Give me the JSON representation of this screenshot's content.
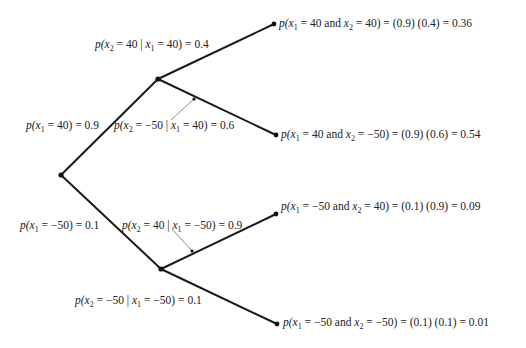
{
  "diagram": {
    "type": "probability-tree",
    "nodes": {
      "root": {
        "x": 61,
        "y": 175
      },
      "mid_upper": {
        "x": 158,
        "y": 79
      },
      "mid_lower": {
        "x": 161,
        "y": 269
      },
      "leaf_1": {
        "x": 274,
        "y": 24
      },
      "leaf_2": {
        "x": 276,
        "y": 135
      },
      "leaf_3": {
        "x": 276,
        "y": 214
      },
      "leaf_4": {
        "x": 277,
        "y": 324
      }
    },
    "edges": [
      {
        "from": "root",
        "to": "mid_upper",
        "label": "p(x1 = 40) = 0.9"
      },
      {
        "from": "root",
        "to": "mid_lower",
        "label": "p(x1 = −50) = 0.1"
      },
      {
        "from": "mid_upper",
        "to": "leaf_1",
        "label": "p(x2 = 40 | x1 = 40) = 0.4"
      },
      {
        "from": "mid_upper",
        "to": "leaf_2",
        "label": "p(x2 = −50 | x1 = 40) = 0.6"
      },
      {
        "from": "mid_lower",
        "to": "leaf_3",
        "label": "p(x2 = 40 | x1 = −50) = 0.9"
      },
      {
        "from": "mid_lower",
        "to": "leaf_4",
        "label": "p(x2 = −50 | x1 = −50) = 0.1"
      }
    ],
    "pointers": [
      {
        "x1": 171,
        "y1": 120,
        "x2": 194,
        "y2": 99
      },
      {
        "x1": 172,
        "y1": 229,
        "x2": 192,
        "y2": 251
      }
    ]
  },
  "labels": {
    "e_root_upper": {
      "p": "p(",
      "x": "x",
      "sub": "1",
      "rest": " = 40) = 0.9"
    },
    "e_root_lower": {
      "p": "p(",
      "x": "x",
      "sub": "1",
      "rest": " = −50) = 0.1"
    },
    "e_up_1": {
      "p": "p(",
      "x2": "x",
      "sub2": "2",
      "mid": " = 40 | ",
      "x1": "x",
      "sub1": "1",
      "rest": " = 40) = 0.4"
    },
    "e_up_2": {
      "p": "p(",
      "x2": "x",
      "sub2": "2",
      "mid": " = −50 | ",
      "x1": "x",
      "sub1": "1",
      "rest": " = 40) = 0.6"
    },
    "e_lo_1": {
      "p": "p(",
      "x2": "x",
      "sub2": "2",
      "mid": " = 40 | ",
      "x1": "x",
      "sub1": "1",
      "rest": " = −50) = 0.9"
    },
    "e_lo_2": {
      "p": "p(",
      "x2": "x",
      "sub2": "2",
      "mid": " = −50 | ",
      "x1": "x",
      "sub1": "1",
      "rest": " = −50) = 0.1"
    },
    "leaf_1": {
      "p": "p(",
      "x1": "x",
      "sub1": "1",
      "mid": " = 40 and ",
      "x2": "x",
      "sub2": "2",
      "rest": " = 40) = (0.9) (0.4) = 0.36"
    },
    "leaf_2": {
      "p": "p(",
      "x1": "x",
      "sub1": "1",
      "mid": " = 40 and ",
      "x2": "x",
      "sub2": "2",
      "rest": " = −50) = (0.9) (0.6) = 0.54"
    },
    "leaf_3": {
      "p": "p(",
      "x1": "x",
      "sub1": "1",
      "mid": " = −50 and ",
      "x2": "x",
      "sub2": "2",
      "rest": " = 40) = (0.1) (0.9) = 0.09"
    },
    "leaf_4": {
      "p": "p(",
      "x1": "x",
      "sub1": "1",
      "mid": " = −50 and ",
      "x2": "x",
      "sub2": "2",
      "rest": " = −50) = (0.1) (0.1) = 0.01"
    }
  },
  "results": [
    {
      "x1": 40,
      "x2": 40,
      "p1": 0.9,
      "p2": 0.4,
      "joint": 0.36
    },
    {
      "x1": 40,
      "x2": -50,
      "p1": 0.9,
      "p2": 0.6,
      "joint": 0.54
    },
    {
      "x1": -50,
      "x2": 40,
      "p1": 0.1,
      "p2": 0.9,
      "joint": 0.09
    },
    {
      "x1": -50,
      "x2": -50,
      "p1": 0.1,
      "p2": 0.1,
      "joint": 0.01
    }
  ],
  "colors": {
    "line": "#1a1a1a",
    "pointer": "#8a8a8a",
    "text": "#222222"
  }
}
